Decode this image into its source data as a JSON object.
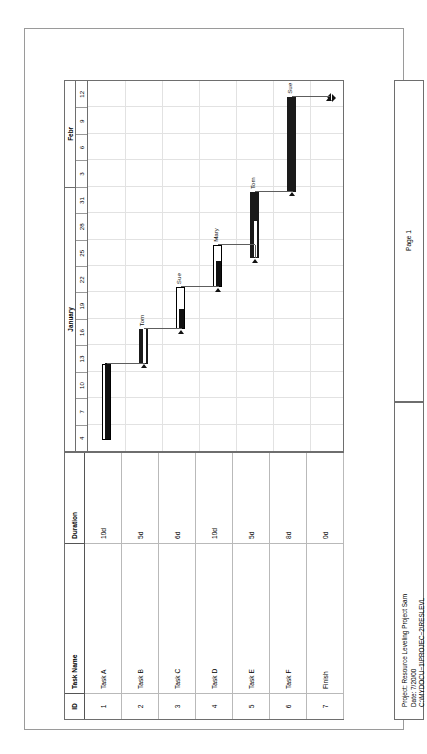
{
  "document": {
    "title": "Schedule Showing Progress",
    "page_label": "Page 1"
  },
  "table": {
    "columns": [
      "ID",
      "Task Name",
      "Duration"
    ],
    "rows": [
      {
        "id": "1",
        "name": "Task A",
        "duration": "10d"
      },
      {
        "id": "2",
        "name": "Task B",
        "duration": "5d"
      },
      {
        "id": "3",
        "name": "Task C",
        "duration": "6d"
      },
      {
        "id": "4",
        "name": "Task D",
        "duration": "10d"
      },
      {
        "id": "5",
        "name": "Task E",
        "duration": "5d"
      },
      {
        "id": "6",
        "name": "Task F",
        "duration": "8d"
      },
      {
        "id": "7",
        "name": "Finish",
        "duration": "0d"
      }
    ]
  },
  "timescale": {
    "major": [
      {
        "label": "January",
        "span": 10
      },
      {
        "label": "Febr",
        "span": 4
      }
    ],
    "minor": [
      "4",
      "7",
      "10",
      "13",
      "16",
      "19",
      "22",
      "25",
      "28",
      "31",
      "3",
      "6",
      "9",
      "12"
    ]
  },
  "gantt": {
    "bars": [
      {
        "task": "Task A",
        "row": 0,
        "start": 0.4,
        "end": 3.3,
        "style": "normal",
        "progress": 1.0,
        "resource": ""
      },
      {
        "task": "Task B",
        "row": 1,
        "start": 3.3,
        "end": 4.6,
        "style": "critical",
        "progress": 1.0,
        "resource": "Tom"
      },
      {
        "task": "Task C",
        "row": 2,
        "start": 4.6,
        "end": 6.2,
        "style": "normal",
        "progress": 0.45,
        "resource": "Sue"
      },
      {
        "task": "Task D",
        "row": 3,
        "start": 6.2,
        "end": 7.8,
        "style": "normal",
        "progress": 0.6,
        "resource": "Mary"
      },
      {
        "task": "Task E",
        "row": 4,
        "start": 7.3,
        "end": 9.8,
        "style": "critical",
        "progress": 0.55,
        "resource": "Tom"
      },
      {
        "task": "Task F",
        "row": 5,
        "start": 9.8,
        "end": 13.4,
        "style": "critical",
        "progress": 0.0,
        "resource": "Sue"
      },
      {
        "task": "Finish",
        "row": 6,
        "start": 13.4,
        "end": 13.4,
        "style": "milestone",
        "progress": 0,
        "resource": ""
      }
    ],
    "resource_labels": [
      "Tom",
      "Sue",
      "Mary",
      "Tom",
      "Sue"
    ]
  },
  "legend": {
    "left_column": [
      {
        "label": "Task",
        "swatch": "white-bar"
      },
      {
        "label": "Task Progress",
        "swatch": "black-bar"
      },
      {
        "label": "Critical Task",
        "swatch": "black-bar"
      },
      {
        "label": "Critical Task Progress",
        "swatch": "white-bar"
      },
      {
        "label": "Milestone",
        "swatch": "thin-line"
      }
    ],
    "right_column": [
      {
        "label": "Summary",
        "swatch": "summary-bar"
      },
      {
        "label": "Rolled Up Task",
        "swatch": "white-bar"
      },
      {
        "label": "Rolled Up Critical Task",
        "swatch": "black-bar"
      },
      {
        "label": "Rolled Up Milestone",
        "swatch": "thin-line"
      },
      {
        "label": "Rolled Up Progress",
        "swatch": "black-bar"
      }
    ]
  },
  "project_info": {
    "line1": "Project: Resource Leveling Project Sam",
    "line2": "Date: 7/20/00",
    "line3": "C:\\MYDOCU~1\\PROJEC~2\\RESLEVL"
  },
  "colors": {
    "critical_bar": "#1a1a1a",
    "normal_bar_fill": "#ffffff",
    "border": "#6e6e6e",
    "gridline": "#e2e2e2",
    "link_line": "#5d5d5d"
  }
}
